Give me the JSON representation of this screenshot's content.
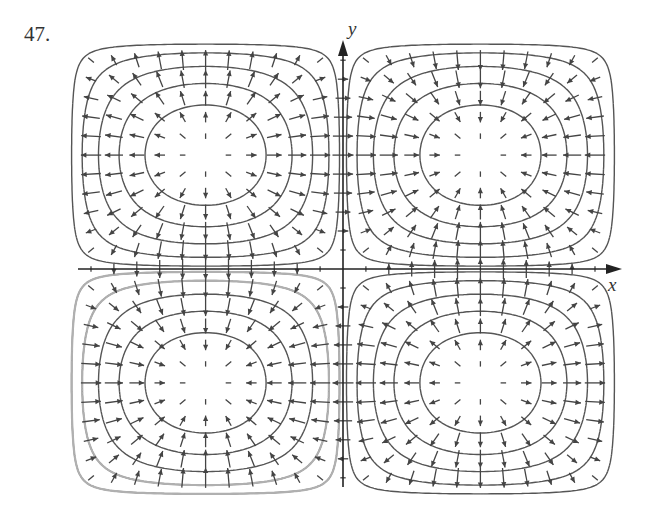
{
  "problem": {
    "number": "47."
  },
  "axes": {
    "x_label": "x",
    "y_label": "y"
  },
  "colors": {
    "contour_dark": "#555555",
    "contour_light": "#b0b0b0",
    "arrow": "#444444",
    "axis": "#222222"
  },
  "chart_data": {
    "type": "vector_field_with_contours",
    "title": "",
    "function": "f(x,y) = sin(x) sin(y)",
    "field": "F(x,y) = (cos x sin y, sin x cos y)",
    "xlim": [
      -3.1416,
      3.1416
    ],
    "ylim": [
      -3.1416,
      3.1416
    ],
    "xlabel": "x",
    "ylabel": "y",
    "grid": false,
    "arrow_grid_step": 0.2618,
    "contour_levels": [
      -0.77,
      -0.55,
      -0.34,
      -0.16,
      -0.04,
      0.04,
      0.16,
      0.34,
      0.55,
      0.77
    ],
    "quadrants": [
      {
        "name": "upper-left",
        "behavior": "source",
        "center": [
          -1.5708,
          1.5708
        ]
      },
      {
        "name": "upper-right",
        "behavior": "sink",
        "center": [
          1.5708,
          1.5708
        ]
      },
      {
        "name": "lower-left",
        "behavior": "sink",
        "center": [
          -1.5708,
          -1.5708
        ]
      },
      {
        "name": "lower-right",
        "behavior": "source",
        "center": [
          1.5708,
          -1.5708
        ]
      }
    ]
  }
}
